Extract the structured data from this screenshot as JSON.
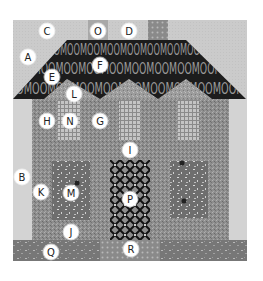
{
  "diagram": {
    "type": "quilt-block",
    "colors": {
      "background": "#ffffff",
      "sky": "#c9c9c9",
      "sashing": "#d2d2d2",
      "roof": "#1e1e1e",
      "roof_text": "#9a9a9a",
      "house_body": "#8e8e8e",
      "gable": "#9a9a9a",
      "checkered_window": "#b4b4b4",
      "lower_window": "#6f6f6f",
      "door": "#2a2a2a",
      "ground": "#7a7a7a",
      "chimney_left": "#a6a6a6",
      "chimney_right": "#999999"
    },
    "roof_print_text": "MOOMOOMOOMOOMOOMOOMOOMOOMOOMOOMOO",
    "labels": [
      {
        "id": "A",
        "x": 28,
        "y": 57
      },
      {
        "id": "B",
        "x": 22,
        "y": 177
      },
      {
        "id": "C",
        "x": 47,
        "y": 31
      },
      {
        "id": "D",
        "x": 129,
        "y": 31
      },
      {
        "id": "E",
        "x": 52,
        "y": 77
      },
      {
        "id": "F",
        "x": 100,
        "y": 65
      },
      {
        "id": "G",
        "x": 100,
        "y": 121
      },
      {
        "id": "H",
        "x": 47,
        "y": 121
      },
      {
        "id": "I",
        "x": 130,
        "y": 150
      },
      {
        "id": "J",
        "x": 71,
        "y": 232
      },
      {
        "id": "K",
        "x": 41,
        "y": 192
      },
      {
        "id": "L",
        "x": 74,
        "y": 94
      },
      {
        "id": "M",
        "x": 71,
        "y": 193
      },
      {
        "id": "N",
        "x": 70,
        "y": 121
      },
      {
        "id": "O",
        "x": 98,
        "y": 31
      },
      {
        "id": "P",
        "x": 130,
        "y": 199
      },
      {
        "id": "Q",
        "x": 51,
        "y": 252
      },
      {
        "id": "R",
        "x": 131,
        "y": 249
      }
    ]
  }
}
